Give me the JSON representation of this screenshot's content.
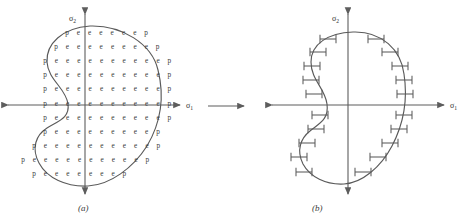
{
  "figure": {
    "width": 464,
    "height": 222,
    "background": "#ffffff",
    "stroke_color": "#5a5a5a",
    "text_color": "#3a3a3a"
  },
  "transition_arrow": {
    "name": "transform-arrow",
    "direction": "right",
    "x1": 208,
    "y1": 106,
    "x2": 244,
    "y2": 106
  },
  "panels": [
    {
      "id": "a",
      "caption": "(a)",
      "axes": {
        "x_label": "σ",
        "x_sub": "1",
        "y_label": "σ",
        "y_sub": "2",
        "origin_x": 85,
        "origin_y": 105,
        "x_min": 8,
        "x_max": 180,
        "y_min": 14,
        "y_max": 194
      },
      "legend": {
        "p": "perimeter node",
        "e": "interior element"
      },
      "grid_rows": [
        {
          "y": 33,
          "x_start": 67,
          "spacing": 11.3,
          "cells": [
            "p",
            "e",
            "e",
            "e",
            "e",
            "e",
            "e",
            "p"
          ]
        },
        {
          "y": 47,
          "x_start": 56,
          "spacing": 11.3,
          "cells": [
            "p",
            "e",
            "e",
            "e",
            "e",
            "e",
            "e",
            "e",
            "e",
            "p"
          ]
        },
        {
          "y": 61,
          "x_start": 45,
          "spacing": 11.3,
          "cells": [
            "p",
            "e",
            "e",
            "e",
            "e",
            "e",
            "e",
            "e",
            "e",
            "e",
            "e",
            "p"
          ]
        },
        {
          "y": 75,
          "x_start": 45,
          "spacing": 11.3,
          "cells": [
            "p",
            "e",
            "e",
            "e",
            "e",
            "e",
            "e",
            "e",
            "e",
            "e",
            "e",
            "p"
          ]
        },
        {
          "y": 89,
          "x_start": 45,
          "spacing": 11.3,
          "cells": [
            "p",
            "e",
            "e",
            "e",
            "e",
            "e",
            "e",
            "e",
            "e",
            "e",
            "e",
            "p"
          ]
        },
        {
          "y": 104,
          "x_start": 45,
          "spacing": 11.3,
          "cells": [
            "p",
            "e",
            "e",
            "e",
            "e",
            "e",
            "e",
            "e",
            "e",
            "e",
            "e",
            "p"
          ]
        },
        {
          "y": 118,
          "x_start": 45,
          "spacing": 11.3,
          "cells": [
            "p",
            "e",
            "e",
            "e",
            "e",
            "e",
            "e",
            "e",
            "e",
            "e",
            "e",
            "p"
          ]
        },
        {
          "y": 132,
          "x_start": 45,
          "spacing": 11.3,
          "cells": [
            "p",
            "e",
            "e",
            "e",
            "e",
            "e",
            "e",
            "e",
            "e",
            "e",
            "p"
          ]
        },
        {
          "y": 146,
          "x_start": 34,
          "spacing": 11.3,
          "cells": [
            "p",
            "e",
            "e",
            "e",
            "e",
            "e",
            "e",
            "e",
            "e",
            "e",
            "e",
            "p"
          ]
        },
        {
          "y": 160,
          "x_start": 23,
          "spacing": 11.3,
          "cells": [
            "p",
            "e",
            "e",
            "e",
            "e",
            "e",
            "e",
            "e",
            "e",
            "e",
            "e",
            "p"
          ]
        },
        {
          "y": 174,
          "x_start": 34,
          "spacing": 11.3,
          "cells": [
            "p",
            "e",
            "e",
            "e",
            "e",
            "e",
            "e",
            "e",
            "p"
          ]
        }
      ],
      "boundary_path": "M 90 26 C 122 25 152 44 158 70 C 165 98 160 124 147 146 C 133 168 110 185 88 186 C 66 187 47 178 39 163 C 31 148 36 135 47 128 C 58 121 70 118 68 104 C 66 88 48 80 47 62 C 46 44 62 28 90 26 Z"
    },
    {
      "id": "b",
      "caption": "(b)",
      "axes": {
        "x_label": "σ",
        "x_sub": "1",
        "y_label": "σ",
        "y_sub": "2",
        "origin_x": 348,
        "origin_y": 105,
        "x_min": 272,
        "x_max": 444,
        "y_min": 14,
        "y_max": 194
      },
      "boundary_path": "M 353 32 C 382 31 401 50 404 74 C 408 100 403 125 392 146 C 381 167 362 183 344 184 C 326 185 310 177 303 164 C 296 150 301 138 310 131 C 320 123 329 119 327 104 C 325 88 311 80 311 62 C 311 44 328 33 353 32 Z",
      "ticks": [
        {
          "cx": 328,
          "cy": 39,
          "len": 16
        },
        {
          "cx": 318,
          "cy": 52,
          "len": 16
        },
        {
          "cx": 312,
          "cy": 66,
          "len": 16
        },
        {
          "cx": 311,
          "cy": 80,
          "len": 16
        },
        {
          "cx": 314,
          "cy": 94,
          "len": 16
        },
        {
          "cx": 320,
          "cy": 115,
          "len": 16
        },
        {
          "cx": 316,
          "cy": 129,
          "len": 16
        },
        {
          "cx": 307,
          "cy": 143,
          "len": 16
        },
        {
          "cx": 299,
          "cy": 157,
          "len": 16
        },
        {
          "cx": 304,
          "cy": 172,
          "len": 16
        },
        {
          "cx": 376,
          "cy": 39,
          "len": 16
        },
        {
          "cx": 390,
          "cy": 52,
          "len": 16
        },
        {
          "cx": 400,
          "cy": 66,
          "len": 16
        },
        {
          "cx": 404,
          "cy": 80,
          "len": 16
        },
        {
          "cx": 405,
          "cy": 94,
          "len": 16
        },
        {
          "cx": 404,
          "cy": 115,
          "len": 16
        },
        {
          "cx": 399,
          "cy": 129,
          "len": 16
        },
        {
          "cx": 390,
          "cy": 143,
          "len": 16
        },
        {
          "cx": 378,
          "cy": 157,
          "len": 16
        },
        {
          "cx": 363,
          "cy": 172,
          "len": 16
        }
      ]
    }
  ]
}
